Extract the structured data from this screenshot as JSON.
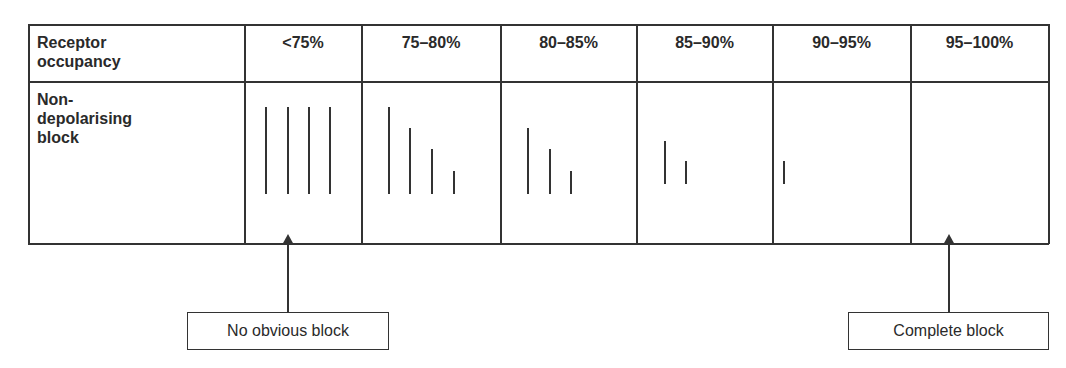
{
  "table": {
    "row_label_header": "Receptor occupancy",
    "row_label_header_lines": [
      "Receptor",
      "occupancy"
    ],
    "row_label": "Non-depolarising block",
    "row_label_lines": [
      "Non-",
      "depolarising",
      "block"
    ],
    "columns": [
      {
        "label": "<75%",
        "twitches": 4,
        "heights_pct": [
          100,
          100,
          100,
          100
        ]
      },
      {
        "label": "75–80%",
        "twitches": 4,
        "heights_pct": [
          100,
          75,
          50,
          25
        ]
      },
      {
        "label": "80–85%",
        "twitches": 3,
        "heights_pct": [
          75,
          50,
          25
        ]
      },
      {
        "label": "85–90%",
        "twitches": 2,
        "heights_pct": [
          50,
          25
        ]
      },
      {
        "label": "90–95%",
        "twitches": 1,
        "heights_pct": [
          25
        ]
      },
      {
        "label": "95–100%",
        "twitches": 0,
        "heights_pct": []
      }
    ]
  },
  "annotations": {
    "left": {
      "label": "No obvious block",
      "points_to": "<75%"
    },
    "right": {
      "label": "Complete block",
      "points_to": "95–100%"
    }
  },
  "colors": {
    "line": "#333333",
    "background": "#ffffff"
  }
}
